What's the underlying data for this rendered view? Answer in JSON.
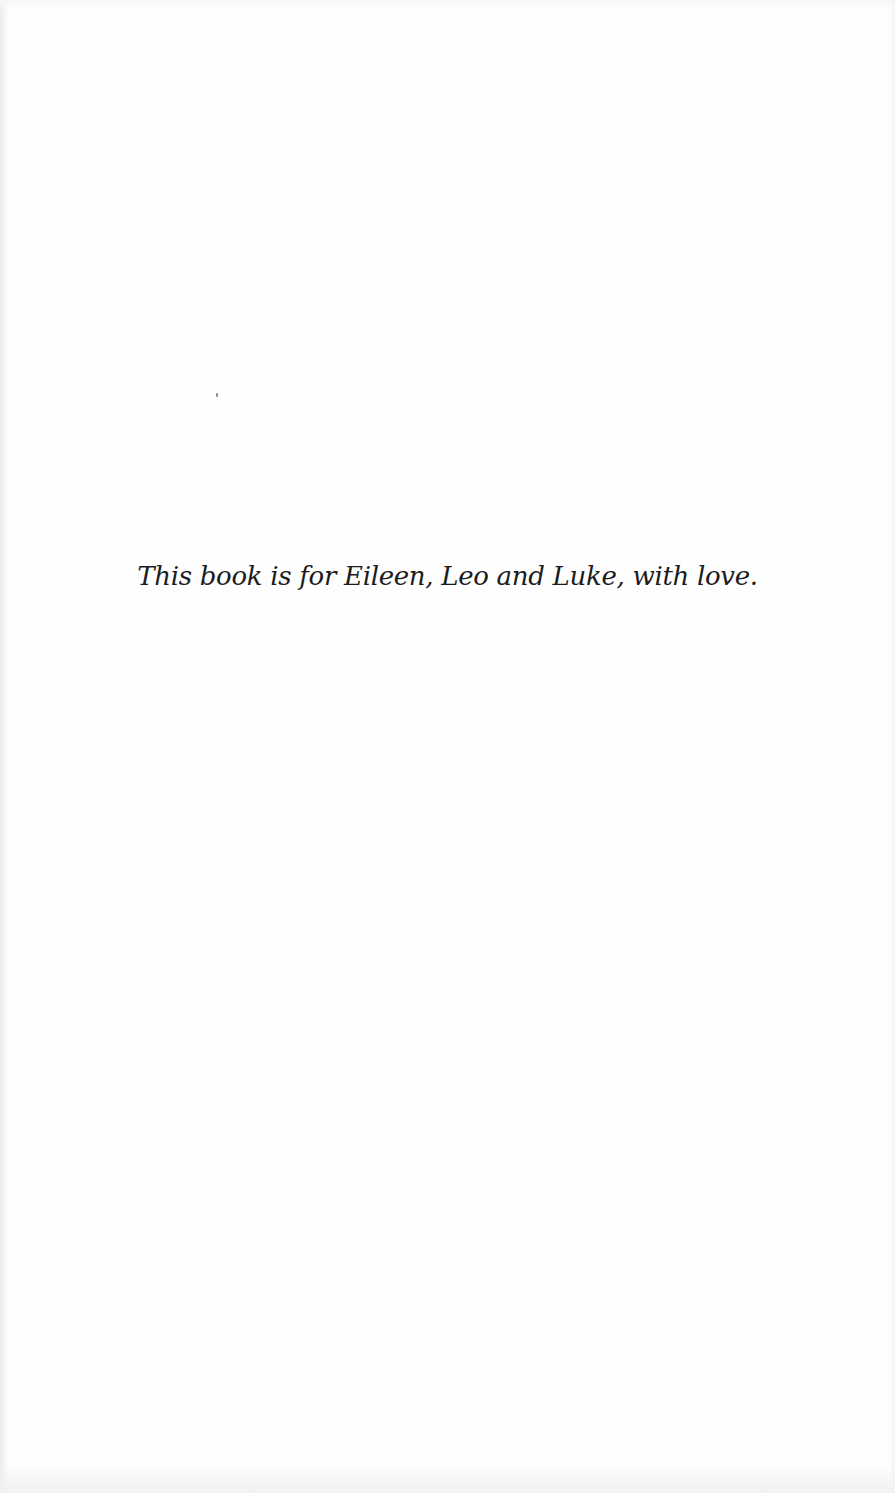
{
  "page": {
    "type": "book-dedication",
    "dedication_text": "This book is for Eileen, Leo and Luke, with love."
  },
  "colors": {
    "paper": "#fefefe",
    "text": "#1c1c1c"
  }
}
